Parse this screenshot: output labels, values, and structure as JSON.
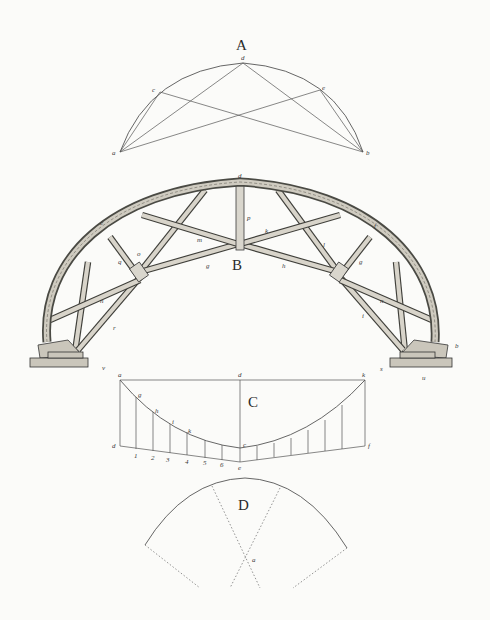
{
  "figures": {
    "A": {
      "label": "A",
      "points": {
        "a": "a",
        "b": "b",
        "c": "c",
        "d": "d",
        "e": "e"
      },
      "description": "Segmental arc with chords and intersecting lines from springing points a and b"
    },
    "B": {
      "label": "B",
      "points": {
        "d": "d",
        "e": "e",
        "f": "f",
        "g1": "g",
        "g2": "g",
        "h": "h",
        "i": "i",
        "k": "k",
        "l": "l",
        "m": "m",
        "n1": "n",
        "n2": "n",
        "o": "o",
        "p": "p",
        "q": "q",
        "r": "r",
        "s": "s",
        "b": "b",
        "u": "u",
        "v": "v"
      },
      "description": "Timber centering truss for a segmental arch with radial and diagonal braces on stepped bases"
    },
    "C": {
      "label": "C",
      "points": {
        "a": "a",
        "d": "d",
        "k": "k",
        "g": "g",
        "h": "h",
        "i": "i",
        "kk": "k",
        "c": "c",
        "e": "e",
        "f": "f",
        "dd": "d"
      },
      "ticks": [
        "1",
        "2",
        "3",
        "4",
        "5",
        "6"
      ],
      "description": "Ordinate construction of a catenary-like curve between a and k"
    },
    "D": {
      "label": "D",
      "points": {
        "a": "a"
      },
      "description": "Arc segment with dotted radial lines meeting at center a"
    }
  }
}
